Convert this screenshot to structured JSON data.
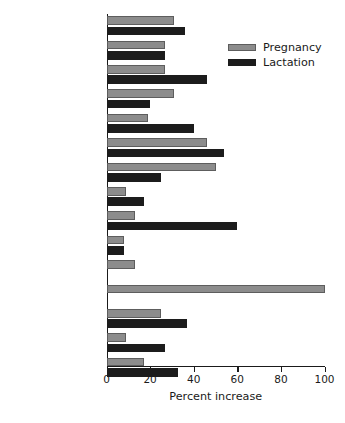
{
  "chart_data": {
    "type": "bar",
    "orientation": "horizontal",
    "title": "",
    "xlabel": "Percent increase",
    "ylabel": "",
    "xlim": [
      0,
      100
    ],
    "xticks": [
      0,
      20,
      40,
      60,
      80,
      100
    ],
    "xticklabels": [
      "0",
      "20",
      "40",
      "60",
      "80",
      "100"
    ],
    "grid": false,
    "legend_position": "top-right",
    "categories": [
      "Protein",
      "Thiamin",
      "Riboflavin",
      "Niacin",
      "Pantothenic acid",
      "Vitamin B6",
      "Folate",
      "Vitamin B12",
      "Vitamin C",
      "Vitamin K",
      "Magnesium",
      "Iron",
      "Zinc",
      "Selenium",
      "Iodine"
    ],
    "categories_display": [
      {
        "text": "Protein",
        "sub": ""
      },
      {
        "text": "Thiamin",
        "sub": ""
      },
      {
        "text": "Riboflavin",
        "sub": ""
      },
      {
        "text": "Niacin",
        "sub": ""
      },
      {
        "text": "Pantothenic acid",
        "sub": ""
      },
      {
        "text": "Vitamin B",
        "sub": "6"
      },
      {
        "text": "Folate",
        "sub": ""
      },
      {
        "text": "Vitamin B",
        "sub": "12"
      },
      {
        "text": "Vitamin C",
        "sub": ""
      },
      {
        "text": "Vitamin K",
        "sub": ""
      },
      {
        "text": "Magnesium",
        "sub": ""
      },
      {
        "text": "Iron",
        "sub": ""
      },
      {
        "text": "Zinc",
        "sub": ""
      },
      {
        "text": "Selenium",
        "sub": ""
      },
      {
        "text": "Iodine",
        "sub": ""
      }
    ],
    "series": [
      {
        "name": "Pregnancy",
        "color": "#8c8c8c",
        "values": [
          31,
          27,
          27,
          31,
          19,
          46,
          50,
          9,
          13,
          8,
          13,
          100,
          25,
          9,
          17
        ]
      },
      {
        "name": "Lactation",
        "color": "#1c1c1c",
        "values": [
          36,
          27,
          46,
          20,
          40,
          54,
          25,
          17,
          60,
          8,
          0,
          0,
          37,
          27,
          33
        ]
      }
    ]
  },
  "legend": {
    "items": [
      {
        "label": "Pregnancy",
        "swatch": "preg"
      },
      {
        "label": "Lactation",
        "swatch": "lact"
      }
    ]
  }
}
